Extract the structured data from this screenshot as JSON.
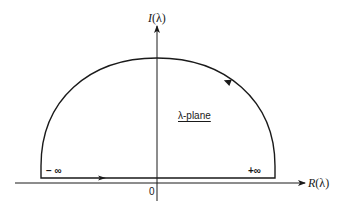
{
  "diagram": {
    "type": "contour-in-complex-plane",
    "vertical_axis": {
      "label_prefix": "I",
      "label_arg": "(λ)"
    },
    "horizontal_axis": {
      "label_prefix": "R",
      "label_arg": "(λ)"
    },
    "origin_label": "0",
    "plane_label": "λ-plane",
    "left_end_label": "− ∞",
    "right_end_label": "+∞",
    "contour": {
      "shape": "upper semicircle closed by real-axis segment",
      "direction": "counter-clockwise",
      "arrows": [
        "along base toward +∞",
        "on arc toward top"
      ]
    },
    "colors": {
      "stroke": "#1a1a1a",
      "background": "#ffffff"
    }
  }
}
